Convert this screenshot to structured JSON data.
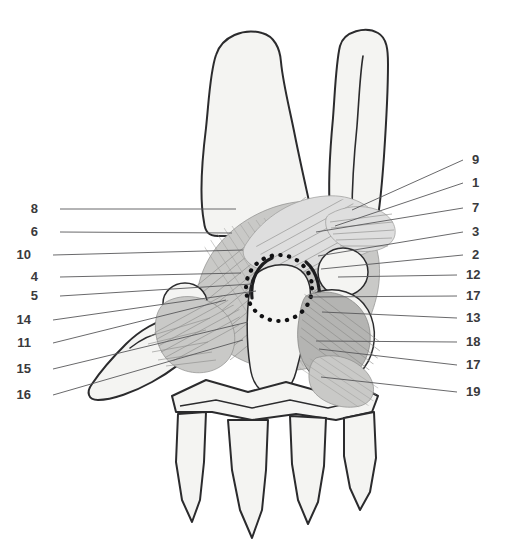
{
  "figure": {
    "canvas": {
      "width": 511,
      "height": 555
    },
    "background_color": "#ffffff",
    "line_color": "#2b2b2d",
    "leader_color": "#58585a",
    "label_color": "#3a3a3c",
    "bone_fill": "#f4f4f2",
    "ligament_fill_light": "#dedede",
    "ligament_fill_mid": "#c9c9c7",
    "ligament_fill_dark": "#b4b4b2",
    "highlight_color": "#111113"
  },
  "labels_left": [
    {
      "number": "8",
      "x": 38,
      "y": 213,
      "line_to_x": 236,
      "line_to_y": 209
    },
    {
      "number": "6",
      "x": 38,
      "y": 236,
      "line_to_x": 232,
      "line_to_y": 233
    },
    {
      "number": "10",
      "x": 31,
      "y": 259,
      "line_to_x": 243,
      "line_to_y": 250
    },
    {
      "number": "4",
      "x": 38,
      "y": 281,
      "line_to_x": 241,
      "line_to_y": 273
    },
    {
      "number": "5",
      "x": 38,
      "y": 300,
      "line_to_x": 252,
      "line_to_y": 284
    },
    {
      "number": "14",
      "x": 31,
      "y": 324,
      "line_to_x": 256,
      "line_to_y": 291
    },
    {
      "number": "11",
      "x": 31,
      "y": 347,
      "line_to_x": 226,
      "line_to_y": 300
    },
    {
      "number": "15",
      "x": 31,
      "y": 373,
      "line_to_x": 248,
      "line_to_y": 322
    },
    {
      "number": "16",
      "x": 31,
      "y": 399,
      "line_to_x": 243,
      "line_to_y": 340
    }
  ],
  "labels_right": [
    {
      "number": "9",
      "x": 472,
      "y": 164,
      "line_to_x": 352,
      "line_to_y": 210
    },
    {
      "number": "1",
      "x": 472,
      "y": 187,
      "line_to_x": 335,
      "line_to_y": 226
    },
    {
      "number": "7",
      "x": 472,
      "y": 212,
      "line_to_x": 316,
      "line_to_y": 232
    },
    {
      "number": "3",
      "x": 472,
      "y": 236,
      "line_to_x": 318,
      "line_to_y": 256
    },
    {
      "number": "2",
      "x": 472,
      "y": 259,
      "line_to_x": 321,
      "line_to_y": 269
    },
    {
      "number": "12",
      "x": 466,
      "y": 279,
      "line_to_x": 338,
      "line_to_y": 277
    },
    {
      "number": "17",
      "x": 466,
      "y": 300,
      "line_to_x": 308,
      "line_to_y": 297
    },
    {
      "number": "13",
      "x": 466,
      "y": 322,
      "line_to_x": 322,
      "line_to_y": 312
    },
    {
      "number": "18",
      "x": 466,
      "y": 346,
      "line_to_x": 316,
      "line_to_y": 341
    },
    {
      "number": "17",
      "x": 466,
      "y": 369,
      "line_to_x": 319,
      "line_to_y": 349
    },
    {
      "number": "19",
      "x": 466,
      "y": 396,
      "line_to_x": 321,
      "line_to_y": 377
    }
  ],
  "structures": {
    "radius": "radius-shaft",
    "ulna": "ulna-shaft",
    "trapezium": "trapezium",
    "pisiform": "pisiform",
    "capitate": "capitate",
    "metacarpals": [
      "metacarpal-1",
      "metacarpal-2",
      "metacarpal-3",
      "metacarpal-4",
      "metacarpal-5"
    ],
    "highlight": "dotted-circle-highlight"
  }
}
